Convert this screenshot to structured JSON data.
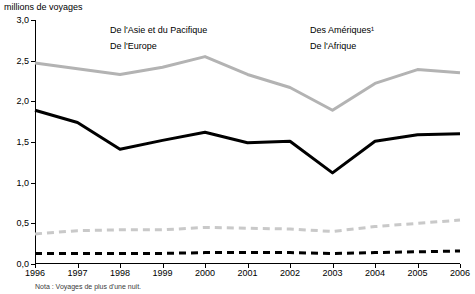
{
  "chart_data": {
    "type": "line",
    "title": "",
    "ylabel": "millions de voyages",
    "xlabel": "",
    "ylim": [
      0.0,
      3.0
    ],
    "yticks": [
      "0,0",
      "0,5",
      "1,0",
      "1,5",
      "2,0",
      "2,5",
      "3,0"
    ],
    "ytick_values": [
      0.0,
      0.5,
      1.0,
      1.5,
      2.0,
      2.5,
      3.0
    ],
    "grid": false,
    "legend_position": "top-inside",
    "categories": [
      "1996",
      "1997",
      "1998",
      "1999",
      "2000",
      "2001",
      "2002",
      "2003",
      "2004",
      "2005",
      "2006"
    ],
    "series": [
      {
        "name": "De l'Asie et du Pacifique",
        "color": "#000000",
        "style": "solid-thick",
        "values": [
          1.89,
          1.74,
          1.41,
          1.52,
          1.62,
          1.49,
          1.51,
          1.12,
          1.51,
          1.59,
          1.6
        ]
      },
      {
        "name": "De l'Europe",
        "color": "#b3b3b3",
        "style": "solid-thick",
        "values": [
          2.47,
          2.4,
          2.33,
          2.42,
          2.55,
          2.33,
          2.17,
          1.89,
          2.22,
          2.39,
          2.35
        ]
      },
      {
        "name": "Des Amériques¹",
        "color": "#c9c9c9",
        "style": "dashed-thick",
        "values": [
          0.37,
          0.41,
          0.42,
          0.42,
          0.45,
          0.44,
          0.43,
          0.4,
          0.46,
          0.5,
          0.54
        ]
      },
      {
        "name": "De l'Afrique",
        "color": "#000000",
        "style": "dashed-thick",
        "values": [
          0.13,
          0.13,
          0.13,
          0.13,
          0.14,
          0.14,
          0.14,
          0.13,
          0.14,
          0.15,
          0.16
        ]
      }
    ],
    "footnote": "Nota : Voyages de plus d'une nuit."
  }
}
